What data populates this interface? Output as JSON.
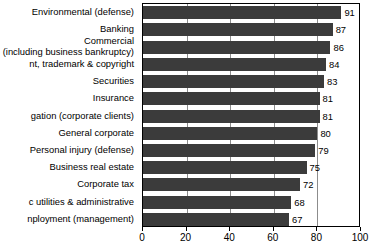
{
  "chart_data": {
    "type": "bar",
    "orientation": "horizontal",
    "title": "",
    "subtitle": "",
    "xlabel": "",
    "ylabel": "",
    "xlim": [
      0,
      100
    ],
    "xticks": [
      0,
      20,
      40,
      60,
      80,
      100
    ],
    "grid": true,
    "grid_axis": "x",
    "legend": false,
    "legend_position": "none",
    "bar_color": "#3b3b3b",
    "axis_color": "#000000",
    "grid_color": "#8c8c8c",
    "background": "#ffffff",
    "value_labels": true,
    "categories": [
      "Environmental (defense)",
      "Banking",
      "Commercial (including business bankruptcy)",
      "Patent, trademark & copyright",
      "Securities",
      "Insurance",
      "Litigation (corporate clients)",
      "General corporate",
      "Personal injury (defense)",
      "Business real estate",
      "Corporate tax",
      "Public utilities & administrative",
      "Employment (management)"
    ],
    "category_lines": [
      [
        "Environmental (defense)"
      ],
      [
        "Banking"
      ],
      [
        "Commercial",
        "(including business bankruptcy)"
      ],
      [
        "nt, trademark & copyright"
      ],
      [
        "Securities"
      ],
      [
        "Insurance"
      ],
      [
        "gation (corporate clients)"
      ],
      [
        "General corporate"
      ],
      [
        "Personal injury (defense)"
      ],
      [
        "Business real estate"
      ],
      [
        "Corporate tax"
      ],
      [
        "c utilities & administrative"
      ],
      [
        "nployment (management)"
      ]
    ],
    "values": [
      91,
      87,
      86,
      84,
      83,
      81,
      81,
      80,
      79,
      75,
      72,
      68,
      67
    ]
  },
  "axis": {
    "tick_labels": [
      "0",
      "20",
      "40",
      "60",
      "80",
      "100"
    ]
  }
}
